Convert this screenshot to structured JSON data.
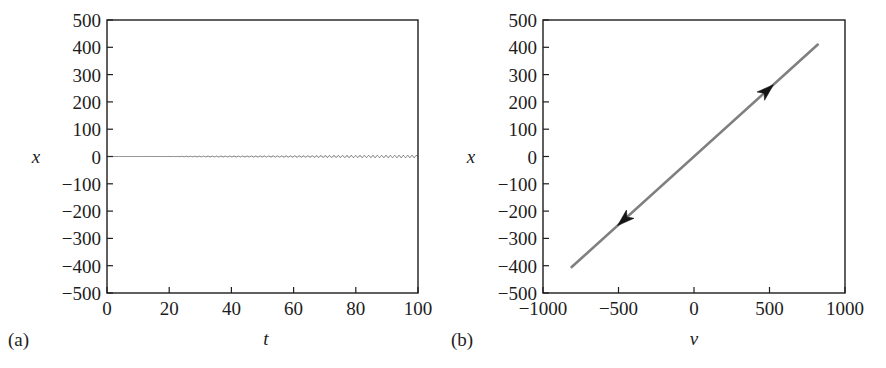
{
  "figure": {
    "background": "#ffffff",
    "ink_color": "#1d1d1d",
    "curve_color": "#808080",
    "panels": [
      "a",
      "b"
    ]
  },
  "panel_a": {
    "tag": "(a)",
    "xlabel": "t",
    "ylabel": "x",
    "x_ticks": [
      "0",
      "20",
      "40",
      "60",
      "80",
      "100"
    ],
    "y_ticks": [
      "500",
      "400",
      "300",
      "200",
      "100",
      "0",
      "−100",
      "−200",
      "−300",
      "−400",
      "−500"
    ]
  },
  "panel_b": {
    "tag": "(b)",
    "xlabel": "ν",
    "ylabel": "x",
    "x_ticks": [
      "−1000",
      "−500",
      "0",
      "500",
      "1000"
    ],
    "y_ticks": [
      "500",
      "400",
      "300",
      "200",
      "100",
      "0",
      "−100",
      "−200",
      "−300",
      "−400",
      "−500"
    ],
    "arrow_upper_label": "forward-direction-arrow",
    "arrow_lower_label": "return-direction-arrow"
  },
  "chart_data": [
    {
      "type": "line",
      "id": "panel-a-time-series",
      "title": "",
      "subtitle": "",
      "panel_tag": "(a)",
      "xlabel": "t",
      "ylabel": "x",
      "xlim": [
        0,
        100
      ],
      "ylim": [
        -500,
        500
      ],
      "xticks": [
        0,
        20,
        40,
        60,
        80,
        100
      ],
      "yticks": [
        -500,
        -400,
        -300,
        -200,
        -100,
        0,
        100,
        200,
        300,
        400,
        500
      ],
      "grid": false,
      "legend": null,
      "line_color": "#808080",
      "description": "Linearly growing (unstable) oscillation x(t) = A*t*sin(omega*t)",
      "model": {
        "form": "x(t) = growth_rate * t * sin(omega * t)",
        "growth_rate": 4.1,
        "omega": 4.5,
        "period": 1.4,
        "n_oscillations_over_range": 71
      },
      "envelope": {
        "upper": {
          "x": [
            0,
            100
          ],
          "y": [
            0,
            410
          ]
        },
        "lower": {
          "x": [
            0,
            100
          ],
          "y": [
            0,
            -410
          ]
        }
      },
      "sampled_amplitude": [
        {
          "t": 0,
          "amp": 0
        },
        {
          "t": 10,
          "amp": 41
        },
        {
          "t": 20,
          "amp": 82
        },
        {
          "t": 30,
          "amp": 123
        },
        {
          "t": 40,
          "amp": 164
        },
        {
          "t": 50,
          "amp": 205
        },
        {
          "t": 60,
          "amp": 246
        },
        {
          "t": 70,
          "amp": 287
        },
        {
          "t": 80,
          "amp": 328
        },
        {
          "t": 90,
          "amp": 369
        },
        {
          "t": 100,
          "amp": 410
        }
      ]
    },
    {
      "type": "line",
      "id": "panel-b-phase-portrait",
      "title": "",
      "subtitle": "",
      "panel_tag": "(b)",
      "xlabel": "ν",
      "ylabel": "x",
      "xlim": [
        -1000,
        1000
      ],
      "ylim": [
        -500,
        500
      ],
      "xticks": [
        -1000,
        -500,
        0,
        500,
        1000
      ],
      "yticks": [
        -500,
        -400,
        -300,
        -200,
        -100,
        0,
        100,
        200,
        300,
        400,
        500
      ],
      "grid": false,
      "legend": null,
      "line_color": "#808080",
      "description": "Phase-plane trajectory x versus nu: a straight line of slope ~0.5 traversed back and forth",
      "x": [
        -810,
        820
      ],
      "y": [
        -405,
        410
      ],
      "slope": 0.5,
      "intercept": 0,
      "annotations": [
        {
          "name": "forward-direction-arrow",
          "at_x": 480,
          "at_y": 240,
          "direction": "up-right"
        },
        {
          "name": "return-direction-arrow",
          "at_x": -460,
          "at_y": -230,
          "direction": "down-left"
        }
      ]
    }
  ]
}
